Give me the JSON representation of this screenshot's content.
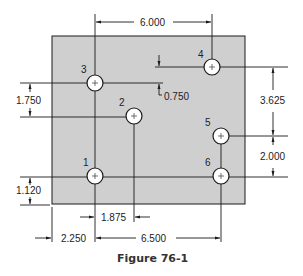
{
  "figure": {
    "caption": "Figure 76-1",
    "plate_color": "#cfcfcf"
  },
  "holes": [
    {
      "id": "1",
      "label": "1",
      "cx": 95,
      "cy": 176
    },
    {
      "id": "2",
      "label": "2",
      "cx": 134,
      "cy": 116
    },
    {
      "id": "3",
      "label": "3",
      "cx": 95,
      "cy": 83
    },
    {
      "id": "4",
      "label": "4",
      "cx": 212,
      "cy": 67
    },
    {
      "id": "5",
      "label": "5",
      "cx": 221,
      "cy": 136
    },
    {
      "id": "6",
      "label": "6",
      "cx": 221,
      "cy": 176
    }
  ],
  "dimensions": {
    "top_6000": "6.000",
    "left_1750": "1.750",
    "mid_0750": "0.750",
    "right_3625": "3.625",
    "right_2000": "2.000",
    "left_1120": "1.120",
    "bottom_1875": "1.875",
    "bottom_2250": "2.250",
    "bottom_6500": "6.500"
  }
}
